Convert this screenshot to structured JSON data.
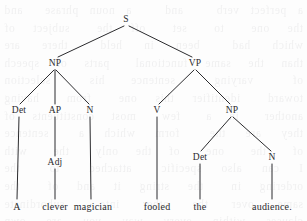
{
  "figure": {
    "type": "syntactic-parse-tree",
    "sentence": "A clever magician fooled the audience.",
    "ink_color": "#2b2b2e",
    "background_color": "#fdfdfd",
    "bleed_text": "a perfect verb   and   a noun phrase  and   the  one   to   set   off  the   subject  of   which  had   been  in  held   there  are  than  the  same  functional   parts  of  speech   of   varying   sentence  his   selection   toward   identifier  this  one   from   having   another   in  a   few   most  constituents  of   they  are  the   form  which  a   sentence  of   the   one   of  the  only   the   with  I  can  also  specific   attached   to   the  ordering  in   the  string  it  and  of   the   same  over  the  other  into   subordinate   clauses  within  every  way  you  are  own   have  you  can  see  how  to  balance  after  one  which  are   to  the   parse  of   every  one  sentence"
  },
  "tree": {
    "nodes": [
      {
        "id": "S",
        "label": "S",
        "x": 126,
        "y": 19,
        "kind": "nonterminal"
      },
      {
        "id": "NP1",
        "label": "NP",
        "x": 55,
        "y": 63,
        "kind": "nonterminal"
      },
      {
        "id": "VP",
        "label": "VP",
        "x": 195,
        "y": 63,
        "kind": "nonterminal"
      },
      {
        "id": "Det1",
        "label": "Det",
        "x": 19,
        "y": 110,
        "kind": "nonterminal"
      },
      {
        "id": "AP",
        "label": "AP",
        "x": 55,
        "y": 110,
        "kind": "nonterminal"
      },
      {
        "id": "N1",
        "label": "N",
        "x": 90,
        "y": 110,
        "kind": "nonterminal"
      },
      {
        "id": "V",
        "label": "V",
        "x": 157,
        "y": 110,
        "kind": "nonterminal"
      },
      {
        "id": "NP2",
        "label": "NP",
        "x": 232,
        "y": 110,
        "kind": "nonterminal"
      },
      {
        "id": "Adj",
        "label": "Adj",
        "x": 55,
        "y": 162,
        "kind": "nonterminal"
      },
      {
        "id": "Det2",
        "label": "Det",
        "x": 200,
        "y": 157,
        "kind": "nonterminal"
      },
      {
        "id": "N2",
        "label": "N",
        "x": 272,
        "y": 157,
        "kind": "nonterminal"
      },
      {
        "id": "wA",
        "label": "A",
        "x": 17,
        "y": 206,
        "kind": "terminal"
      },
      {
        "id": "wclever",
        "label": "clever",
        "x": 55,
        "y": 206,
        "kind": "terminal"
      },
      {
        "id": "wmag",
        "label": "magician",
        "x": 93,
        "y": 206,
        "kind": "terminal"
      },
      {
        "id": "wfooled",
        "label": "fooled",
        "x": 157,
        "y": 206,
        "kind": "terminal"
      },
      {
        "id": "wthe",
        "label": "the",
        "x": 200,
        "y": 206,
        "kind": "terminal"
      },
      {
        "id": "waud",
        "label": "audience.",
        "x": 272,
        "y": 206,
        "kind": "terminal"
      }
    ],
    "edges": [
      {
        "from": "S",
        "to": "NP1",
        "x1": 124,
        "y1": 26,
        "x2": 58,
        "y2": 57
      },
      {
        "from": "S",
        "to": "VP",
        "x1": 129,
        "y1": 26,
        "x2": 192,
        "y2": 57
      },
      {
        "from": "NP1",
        "to": "Det1",
        "x1": 54,
        "y1": 70,
        "x2": 20,
        "y2": 104
      },
      {
        "from": "NP1",
        "to": "AP",
        "x1": 55,
        "y1": 70,
        "x2": 55,
        "y2": 104
      },
      {
        "from": "NP1",
        "to": "N1",
        "x1": 56,
        "y1": 70,
        "x2": 89,
        "y2": 104
      },
      {
        "from": "VP",
        "to": "V",
        "x1": 194,
        "y1": 70,
        "x2": 159,
        "y2": 104
      },
      {
        "from": "VP",
        "to": "NP2",
        "x1": 196,
        "y1": 70,
        "x2": 230,
        "y2": 104
      },
      {
        "from": "Det1",
        "to": "wA",
        "x1": 19,
        "y1": 117,
        "x2": 17,
        "y2": 199
      },
      {
        "from": "AP",
        "to": "Adj",
        "x1": 55,
        "y1": 117,
        "x2": 55,
        "y2": 156
      },
      {
        "from": "Adj",
        "to": "wclever",
        "x1": 55,
        "y1": 169,
        "x2": 55,
        "y2": 199
      },
      {
        "from": "N1",
        "to": "wmag",
        "x1": 90,
        "y1": 117,
        "x2": 91,
        "y2": 199
      },
      {
        "from": "V",
        "to": "wfooled",
        "x1": 157,
        "y1": 117,
        "x2": 157,
        "y2": 199
      },
      {
        "from": "NP2",
        "to": "Det2",
        "x1": 231,
        "y1": 117,
        "x2": 201,
        "y2": 151
      },
      {
        "from": "NP2",
        "to": "N2",
        "x1": 233,
        "y1": 117,
        "x2": 271,
        "y2": 151
      },
      {
        "from": "Det2",
        "to": "wthe",
        "x1": 200,
        "y1": 164,
        "x2": 200,
        "y2": 199
      },
      {
        "from": "N2",
        "to": "waud",
        "x1": 272,
        "y1": 164,
        "x2": 272,
        "y2": 199
      }
    ]
  }
}
